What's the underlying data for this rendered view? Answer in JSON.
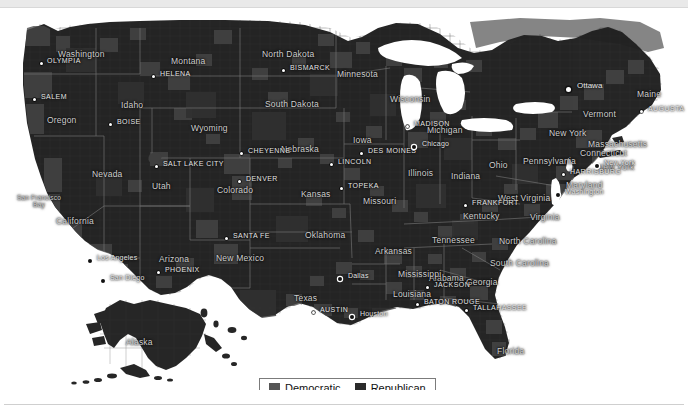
{
  "map": {
    "title": "United States presidential election results by county",
    "background_color": "#ffffff",
    "land_color": "#2a2a2a",
    "legend": {
      "items": [
        {
          "label": "Democratic",
          "color": "#555555",
          "key": "democratic"
        },
        {
          "label": "Republican",
          "color": "#2b2b2b",
          "key": "republican"
        }
      ]
    },
    "states": [
      {
        "name": "Washington",
        "x": 58,
        "y": 41
      },
      {
        "name": "Oregon",
        "x": 47,
        "y": 107
      },
      {
        "name": "Idaho",
        "x": 121,
        "y": 92
      },
      {
        "name": "Montana",
        "x": 171,
        "y": 48
      },
      {
        "name": "Wyoming",
        "x": 191,
        "y": 115
      },
      {
        "name": "North Dakota",
        "x": 262,
        "y": 41
      },
      {
        "name": "South Dakota",
        "x": 265,
        "y": 91
      },
      {
        "name": "Nebraska",
        "x": 281,
        "y": 136
      },
      {
        "name": "Minnesota",
        "x": 337,
        "y": 61
      },
      {
        "name": "Wisconsin",
        "x": 390,
        "y": 86
      },
      {
        "name": "Iowa",
        "x": 353,
        "y": 127
      },
      {
        "name": "Michigan",
        "x": 427,
        "y": 117
      },
      {
        "name": "Nevada",
        "x": 92,
        "y": 161
      },
      {
        "name": "Utah",
        "x": 152,
        "y": 173
      },
      {
        "name": "Colorado",
        "x": 217,
        "y": 177
      },
      {
        "name": "Kansas",
        "x": 301,
        "y": 181
      },
      {
        "name": "Missouri",
        "x": 363,
        "y": 188
      },
      {
        "name": "Illinois",
        "x": 408,
        "y": 160
      },
      {
        "name": "Indiana",
        "x": 451,
        "y": 163
      },
      {
        "name": "Ohio",
        "x": 489,
        "y": 152
      },
      {
        "name": "Pennsylvania",
        "x": 523,
        "y": 148
      },
      {
        "name": "New York",
        "x": 549,
        "y": 120
      },
      {
        "name": "Vermont",
        "x": 583,
        "y": 101
      },
      {
        "name": "Maine",
        "x": 637,
        "y": 81
      },
      {
        "name": "Massachusetts",
        "x": 588,
        "y": 131
      },
      {
        "name": "Connecticut",
        "x": 580,
        "y": 140
      },
      {
        "name": "New York",
        "x": 597,
        "y": 154
      },
      {
        "name": "Maryland",
        "x": 566,
        "y": 172
      },
      {
        "name": "West Virginia",
        "x": 498,
        "y": 185
      },
      {
        "name": "Virginia",
        "x": 530,
        "y": 204
      },
      {
        "name": "Kentucky",
        "x": 463,
        "y": 203
      },
      {
        "name": "Tennessee",
        "x": 432,
        "y": 227
      },
      {
        "name": "North Carolina",
        "x": 499,
        "y": 228
      },
      {
        "name": "South Carolina",
        "x": 490,
        "y": 250
      },
      {
        "name": "Georgia",
        "x": 466,
        "y": 269
      },
      {
        "name": "Alabama",
        "x": 429,
        "y": 265
      },
      {
        "name": "Mississippi",
        "x": 398,
        "y": 261
      },
      {
        "name": "Arkansas",
        "x": 375,
        "y": 238
      },
      {
        "name": "Louisiana",
        "x": 393,
        "y": 281
      },
      {
        "name": "Oklahoma",
        "x": 305,
        "y": 222
      },
      {
        "name": "Texas",
        "x": 294,
        "y": 285
      },
      {
        "name": "New Mexico",
        "x": 216,
        "y": 245
      },
      {
        "name": "Arizona",
        "x": 159,
        "y": 246
      },
      {
        "name": "California",
        "x": 56,
        "y": 208
      },
      {
        "name": "Florida",
        "x": 497,
        "y": 338
      },
      {
        "name": "Alaska",
        "x": 126,
        "y": 329
      }
    ],
    "capitals": [
      {
        "name": "OLYMPIA",
        "x": 47,
        "y": 52,
        "dx": 40,
        "dy": 54
      },
      {
        "name": "SALEM",
        "x": 41,
        "y": 88,
        "dx": 33,
        "dy": 90
      },
      {
        "name": "BOISE",
        "x": 117,
        "y": 113,
        "dx": 109,
        "dy": 115
      },
      {
        "name": "HELENA",
        "x": 160,
        "y": 65,
        "dx": 152,
        "dy": 67
      },
      {
        "name": "BISMARCK",
        "x": 290,
        "y": 59,
        "dx": 282,
        "dy": 61
      },
      {
        "name": "CHEYENNE",
        "x": 248,
        "y": 142,
        "dx": 240,
        "dy": 144
      },
      {
        "name": "SALT LAKE CITY",
        "x": 163,
        "y": 155,
        "dx": 155,
        "dy": 157
      },
      {
        "name": "DENVER",
        "x": 246,
        "y": 170,
        "dx": 238,
        "dy": 172
      },
      {
        "name": "LINCOLN",
        "x": 338,
        "y": 153,
        "dx": 330,
        "dy": 155
      },
      {
        "name": "DES MOINES",
        "x": 368,
        "y": 142,
        "dx": 360,
        "dy": 144
      },
      {
        "name": "MADISON",
        "x": 414,
        "y": 115,
        "dx": 406,
        "dy": 117
      },
      {
        "name": "TOPEKA",
        "x": 348,
        "y": 177,
        "dx": 340,
        "dy": 179
      },
      {
        "name": "SANTA FE",
        "x": 233,
        "y": 227,
        "dx": 225,
        "dy": 229
      },
      {
        "name": "PHOENIX",
        "x": 165,
        "y": 261,
        "dx": 157,
        "dy": 263
      },
      {
        "name": "FRANKFORT",
        "x": 472,
        "y": 194,
        "dx": 464,
        "dy": 196
      },
      {
        "name": "HARRISBURG",
        "x": 570,
        "y": 163,
        "dx": 562,
        "dy": 165
      },
      {
        "name": "AUGUSTA",
        "x": 648,
        "y": 100,
        "dx": 640,
        "dy": 102
      },
      {
        "name": "JACKSON",
        "x": 434,
        "y": 276,
        "dx": 426,
        "dy": 278
      },
      {
        "name": "BATON ROUGE",
        "x": 424,
        "y": 293,
        "dx": 416,
        "dy": 295
      },
      {
        "name": "TALLAHASSEE",
        "x": 473,
        "y": 299,
        "dx": 465,
        "dy": 301
      },
      {
        "name": "AUSTIN",
        "x": 320,
        "y": 301,
        "dx": 312,
        "dy": 303
      }
    ],
    "cities": [
      {
        "name": "Chicago",
        "x": 422,
        "y": 136,
        "dx": 412,
        "dy": 137
      },
      {
        "name": "Washington",
        "x": 565,
        "y": 184,
        "dx": 556,
        "dy": 185
      },
      {
        "name": "New York",
        "x": 604,
        "y": 155,
        "dx": 595,
        "dy": 156
      },
      {
        "name": "Dallas",
        "x": 348,
        "y": 268,
        "dx": 338,
        "dy": 269
      },
      {
        "name": "Houston",
        "x": 360,
        "y": 306,
        "dx": 350,
        "dy": 307
      },
      {
        "name": "Los Angeles",
        "x": 97,
        "y": 250,
        "dx": 88,
        "dy": 251
      },
      {
        "name": "San Diego",
        "x": 110,
        "y": 270,
        "dx": 101,
        "dy": 271
      }
    ],
    "foreign_capitals": [
      {
        "name": "Ottawa",
        "x": 577,
        "y": 78,
        "dx": 566,
        "dy": 79
      }
    ],
    "water_labels": [
      {
        "name": "San Francisco Bay",
        "x": 16,
        "y": 186
      }
    ]
  }
}
